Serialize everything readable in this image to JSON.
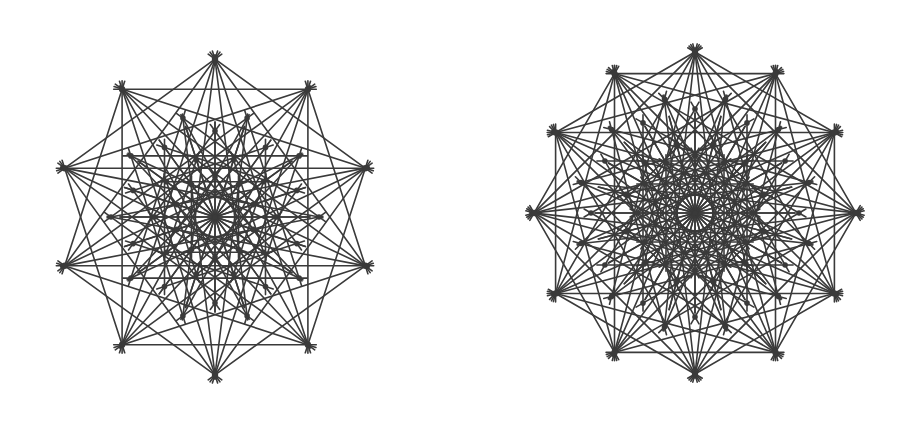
{
  "figures": [
    {
      "name": "ten-fold-configuration",
      "center": [
        215,
        217
      ],
      "symmetry": 10,
      "start_angle_deg": 90,
      "rings": [
        {
          "radius": 158,
          "offset_deg": 0
        },
        {
          "radius": 104,
          "offset_deg": 18
        },
        {
          "radius": 86,
          "offset_deg": 0
        },
        {
          "radius": 60,
          "offset_deg": 18
        },
        {
          "radius": 40,
          "offset_deg": 0
        }
      ],
      "star_skips": [
        2,
        3,
        4
      ],
      "radial_spokes": 20,
      "spoke_length": 95,
      "extension": 14,
      "color": "#3a3a3a"
    },
    {
      "name": "twelve-fold-configuration",
      "center": [
        695,
        213
      ],
      "symmetry": 12,
      "start_angle_deg": 90,
      "rings": [
        {
          "radius": 161,
          "offset_deg": 0
        },
        {
          "radius": 118,
          "offset_deg": 15
        },
        {
          "radius": 104,
          "offset_deg": 0
        },
        {
          "radius": 72,
          "offset_deg": 15
        },
        {
          "radius": 58,
          "offset_deg": 0
        }
      ],
      "star_skips": [
        2,
        3,
        4,
        5
      ],
      "radial_spokes": 24,
      "spoke_length": 100,
      "extension": 14,
      "color": "#3a3a3a"
    }
  ]
}
